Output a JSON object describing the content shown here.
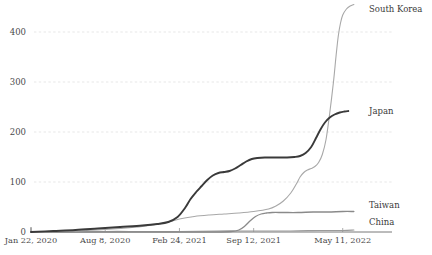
{
  "chart_data": {
    "type": "line",
    "title": "",
    "xlabel": "",
    "ylabel": "",
    "grid": true,
    "legend_position": "right-inline-labels",
    "ylim": [
      0,
      455
    ],
    "yticks": [
      0,
      100,
      200,
      300,
      400
    ],
    "ytick_labels": [
      "0",
      "100",
      "200",
      "300",
      "400"
    ],
    "xticks": [
      0,
      200,
      400,
      600,
      840
    ],
    "xtick_labels": [
      "Jan 22, 2020",
      "Aug 8, 2020",
      "Feb 24, 2021",
      "Sep 12, 2021",
      "May 11, 2022"
    ],
    "xlim": [
      0,
      900
    ],
    "series": [
      {
        "name": "South Korea",
        "color": "#a8a8a8",
        "width": 1.1,
        "label_value": "South Korea",
        "points": [
          [
            0,
            0
          ],
          [
            60,
            1
          ],
          [
            120,
            2
          ],
          [
            180,
            4
          ],
          [
            240,
            7
          ],
          [
            300,
            11
          ],
          [
            360,
            18
          ],
          [
            400,
            26
          ],
          [
            440,
            31
          ],
          [
            480,
            34
          ],
          [
            520,
            36
          ],
          [
            560,
            38
          ],
          [
            600,
            41
          ],
          [
            640,
            46
          ],
          [
            660,
            52
          ],
          [
            680,
            62
          ],
          [
            700,
            78
          ],
          [
            715,
            96
          ],
          [
            725,
            110
          ],
          [
            735,
            119
          ],
          [
            745,
            124
          ],
          [
            755,
            127
          ],
          [
            765,
            131
          ],
          [
            775,
            139
          ],
          [
            785,
            155
          ],
          [
            795,
            185
          ],
          [
            805,
            238
          ],
          [
            815,
            300
          ],
          [
            822,
            352
          ],
          [
            828,
            392
          ],
          [
            834,
            418
          ],
          [
            840,
            434
          ],
          [
            850,
            446
          ],
          [
            860,
            452
          ],
          [
            870,
            455
          ]
        ]
      },
      {
        "name": "Japan",
        "color": "#3a3a3a",
        "width": 1.9,
        "label_value": "Japan",
        "points": [
          [
            0,
            0
          ],
          [
            60,
            2
          ],
          [
            120,
            4
          ],
          [
            180,
            7
          ],
          [
            240,
            10
          ],
          [
            300,
            13
          ],
          [
            340,
            16
          ],
          [
            370,
            20
          ],
          [
            395,
            30
          ],
          [
            415,
            48
          ],
          [
            430,
            66
          ],
          [
            445,
            80
          ],
          [
            460,
            92
          ],
          [
            475,
            104
          ],
          [
            490,
            113
          ],
          [
            505,
            118
          ],
          [
            520,
            120
          ],
          [
            535,
            122
          ],
          [
            550,
            127
          ],
          [
            565,
            134
          ],
          [
            580,
            141
          ],
          [
            595,
            146
          ],
          [
            610,
            148
          ],
          [
            630,
            149
          ],
          [
            660,
            149
          ],
          [
            690,
            149
          ],
          [
            710,
            150
          ],
          [
            725,
            152
          ],
          [
            740,
            158
          ],
          [
            755,
            170
          ],
          [
            768,
            188
          ],
          [
            780,
            205
          ],
          [
            792,
            219
          ],
          [
            805,
            229
          ],
          [
            818,
            235
          ],
          [
            832,
            239
          ],
          [
            845,
            241
          ],
          [
            855,
            242
          ]
        ]
      },
      {
        "name": "Taiwan",
        "color": "#8a8a8a",
        "width": 1.3,
        "label_value": "Taiwan",
        "points": [
          [
            0,
            0
          ],
          [
            200,
            0
          ],
          [
            400,
            0
          ],
          [
            500,
            0
          ],
          [
            540,
            1
          ],
          [
            560,
            4
          ],
          [
            575,
            11
          ],
          [
            590,
            22
          ],
          [
            605,
            31
          ],
          [
            620,
            36
          ],
          [
            635,
            38
          ],
          [
            650,
            39
          ],
          [
            680,
            39
          ],
          [
            720,
            39
          ],
          [
            760,
            40
          ],
          [
            800,
            40
          ],
          [
            840,
            41
          ],
          [
            870,
            41
          ]
        ]
      },
      {
        "name": "China",
        "color": "#9a9a9a",
        "width": 1.2,
        "label_value": "China",
        "points": [
          [
            0,
            0
          ],
          [
            100,
            0
          ],
          [
            200,
            1
          ],
          [
            300,
            1
          ],
          [
            400,
            1
          ],
          [
            500,
            2
          ],
          [
            600,
            2
          ],
          [
            700,
            2
          ],
          [
            780,
            3
          ],
          [
            840,
            3
          ],
          [
            870,
            4
          ]
        ]
      }
    ],
    "annotations": [
      {
        "text": "South Korea",
        "at_x": 870,
        "at_y": 455
      },
      {
        "text": "Japan",
        "at_x": 855,
        "at_y": 242
      },
      {
        "text": "Taiwan",
        "at_x": 870,
        "at_y": 41
      },
      {
        "text": "China",
        "at_x": 870,
        "at_y": 4
      }
    ],
    "colors": {
      "grid": "#dcdcdc",
      "axis": "#555555",
      "text": "#4a4a4a",
      "background": "#ffffff"
    }
  }
}
